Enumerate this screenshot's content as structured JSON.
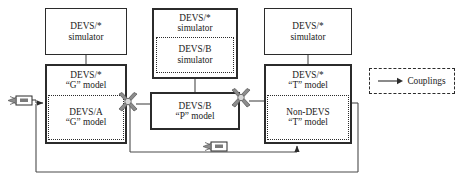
{
  "diagram": {
    "simulators": [
      {
        "id": "sim-left",
        "line1": "DEVS/*",
        "line2": "simulator"
      },
      {
        "id": "sim-mid",
        "line1": "DEVS/*",
        "line2": "simulator",
        "inner": {
          "line1": "DEVS/B",
          "line2": "simulator"
        }
      },
      {
        "id": "sim-right",
        "line1": "DEVS/*",
        "line2": "simulator"
      }
    ],
    "models": [
      {
        "id": "model-left",
        "line1": "DEVS/*",
        "line2": "“G” model",
        "inner": {
          "line1": "DEVS/A",
          "line2": "“G” model"
        }
      },
      {
        "id": "model-mid",
        "line1": "DEVS/B",
        "line2": "“P” model"
      },
      {
        "id": "model-right",
        "line1": "DEVS/*",
        "line2": "“T” model",
        "inner": {
          "line1": "Non-DEVS",
          "line2": "“T” model"
        }
      }
    ],
    "legend": {
      "label": "Couplings"
    },
    "icons": {
      "port_a": "coupling-port-icon",
      "port_b": "coupling-port-icon",
      "tag_in": "message-tag-icon",
      "tag_fb": "message-tag-icon"
    },
    "colors": {
      "stroke": "#2b2b2b",
      "wire": "#4a4a4a",
      "background": "#ffffff",
      "port_fill": "#8c8c8c"
    }
  }
}
